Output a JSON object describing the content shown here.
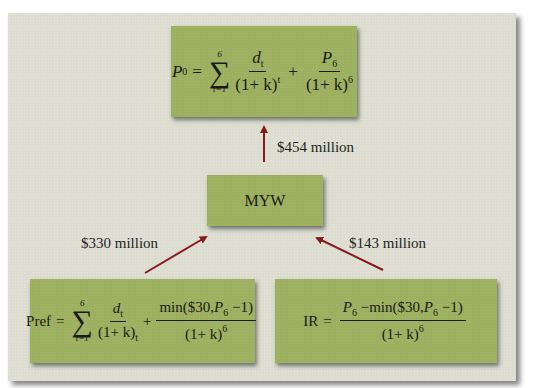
{
  "diagram": {
    "background_color": "#dcddd0",
    "box_color": "#9cb060",
    "arrow_color": "#8b1a1a",
    "top_box": {
      "formula": "P0 = Σ(t=1..6) d_t/(1+k)^t + P6/(1+k)^6",
      "lhs": "P",
      "lhs_sub": "0",
      "sigma_top": "6",
      "sigma_bottom": "t=1",
      "term1_num": "d",
      "term1_num_sub": "t",
      "term1_den": "(1+ k)",
      "term1_den_sup": "t",
      "term2_num": "P",
      "term2_num_sub": "6",
      "term2_den": "(1+ k)",
      "term2_den_sup": "6"
    },
    "middle_box": {
      "label": "MYW"
    },
    "bottom_left_box": {
      "formula": "Pref = Σ(t=1..6) d_t/(1+k)_t + min($30,P6−1)/(1+k)^6",
      "lhs": "Pref",
      "sigma_top": "6",
      "sigma_bottom": "t=1",
      "term1_num": "d",
      "term1_num_sub": "t",
      "term1_den": "(1+ k)",
      "term1_den_sub": "t",
      "term2_num_prefix": "min($30,",
      "term2_num_var": "P",
      "term2_num_var_sub": "6",
      "term2_num_suffix": " −1)",
      "term2_den": "(1+ k)",
      "term2_den_sup": "6"
    },
    "bottom_right_box": {
      "formula": "IR = (P6 − min($30,P6−1))/(1+k)^6",
      "lhs": "IR",
      "num_var": "P",
      "num_var_sub": "6",
      "num_middle": " −min($30,",
      "num_var2": "P",
      "num_var2_sub": "6",
      "num_suffix": " −1)",
      "den": "(1+ k)",
      "den_sup": "6"
    },
    "arrows": [
      {
        "from": "MYW",
        "to": "top_box",
        "label": "$454 million"
      },
      {
        "from": "bottom_left_box",
        "to": "MYW",
        "label": "$330 million"
      },
      {
        "from": "bottom_right_box",
        "to": "MYW",
        "label": "$143 million"
      }
    ]
  }
}
